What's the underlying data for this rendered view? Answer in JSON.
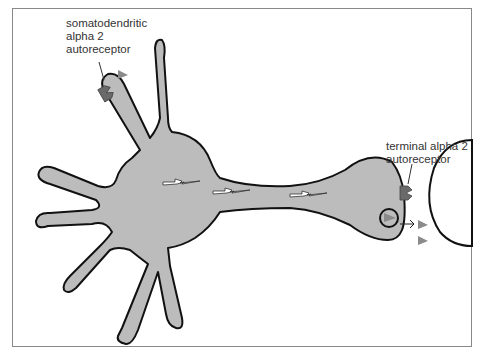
{
  "diagram": {
    "labels": {
      "somatodendritic": "somatodendritic\nalpha 2\nautoreceptor",
      "terminal": "terminal alpha 2\nautoreceptor"
    },
    "elements": [
      "neuron-cell-body",
      "dendrites",
      "axon",
      "axon-terminal",
      "synaptic-vesicle",
      "postsynaptic-cell",
      "neurotransmitter-triangles",
      "nerve-impulse-bolts",
      "release-arrow"
    ],
    "colors": {
      "neuron_fill": "#bcbcbc",
      "outline": "#111111",
      "receptor": "#6a6a6a",
      "transmitter": "#8a8a8a",
      "frame": "#888888"
    }
  }
}
